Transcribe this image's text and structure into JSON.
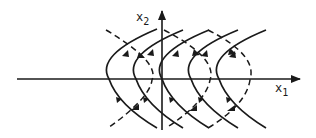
{
  "diagram": {
    "type": "phase-portrait",
    "axes": {
      "horizontal": {
        "label": "x",
        "subscript": "1"
      },
      "vertical": {
        "label": "x",
        "subscript": "2"
      }
    },
    "colors": {
      "stroke": "#1a1a1a",
      "background": "#ffffff"
    },
    "solid_trajectories": {
      "count": 5,
      "vertex_x": [
        109,
        136,
        162,
        191,
        219
      ],
      "style": "solid, opening rightward, arrows pointing toward axis on top half and away on bottom half"
    },
    "dashed_curves": {
      "count": 3,
      "style": "dashed"
    }
  }
}
